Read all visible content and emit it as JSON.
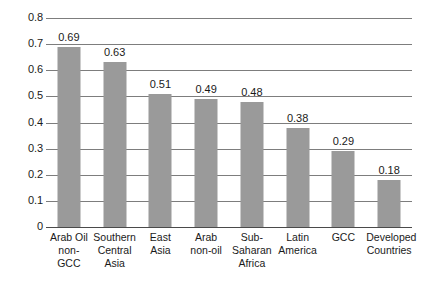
{
  "chart_data": {
    "type": "bar",
    "title": "",
    "subtitle": "",
    "xlabel": "",
    "ylabel": "",
    "ylim": [
      0,
      0.8
    ],
    "ytick_step": 0.1,
    "grid": true,
    "legend": false,
    "legend_position": "none",
    "bar_color": "#9a9a9a",
    "gridline_color": "#7d7d7d",
    "axis_color": "#4a4a4a",
    "text_color": "#1a1a1a",
    "background": "#ffffff",
    "categories": [
      "Arab Oil non-GCC",
      "Southern Central Asia",
      "East Asia",
      "Arab non-oil",
      "Sub-Saharan Africa",
      "Latin America",
      "GCC",
      "Developed Countries"
    ],
    "category_lines": [
      [
        "Arab Oil",
        "non-",
        "GCC"
      ],
      [
        "Southern",
        "Central",
        "Asia"
      ],
      [
        "East",
        "Asia"
      ],
      [
        "Arab",
        "non-oil"
      ],
      [
        "Sub-",
        "Saharan",
        "Africa"
      ],
      [
        "Latin",
        "America"
      ],
      [
        "GCC"
      ],
      [
        "Developed",
        "Countries"
      ]
    ],
    "values": [
      0.69,
      0.63,
      0.51,
      0.49,
      0.48,
      0.38,
      0.29,
      0.18
    ],
    "value_labels": [
      "0.69",
      "0.63",
      "0.51",
      "0.49",
      "0.48",
      "0.38",
      "0.29",
      "0.18"
    ],
    "ytick_labels": [
      "0.8",
      "0.7",
      "0.6",
      "0.5",
      "0.4",
      "0.3",
      "0.2",
      "0.1",
      "0"
    ],
    "ytick_values": [
      0.8,
      0.7,
      0.6,
      0.5,
      0.4,
      0.3,
      0.2,
      0.1,
      0
    ]
  }
}
